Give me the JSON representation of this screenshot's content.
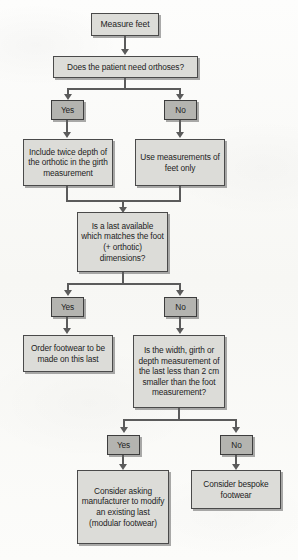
{
  "figure": {
    "type": "flowchart",
    "background_color": "#fbfbf9",
    "node_fill_color": "#dcdcd8",
    "branch_fill_color": "#b4b4b0",
    "border_color": "#4a4a4a",
    "connector_color": "#5b5b5b"
  },
  "nodes": {
    "measure_feet": "Measure feet",
    "need_orthoses": "Does the patient need orthoses?",
    "branch_orthoses_yes": "Yes",
    "branch_orthoses_no": "No",
    "include_twice_depth": "Include twice depth of the orthotic in the girth measurement",
    "use_measurements_feet": "Use measurements of feet only",
    "last_available": "Is a last available which matches the foot (+ orthotic) dimensions?",
    "branch_last_yes": "Yes",
    "branch_last_no": "No",
    "order_footwear": "Order footwear to be made on this last",
    "width_girth_depth": "Is the width, girth or depth measurement of the last less than 2 cm smaller than the foot measurement?",
    "branch_width_yes": "Yes",
    "branch_width_no": "No",
    "consider_modular": "Consider asking manufacturer to modify an existing last (modular footwear)",
    "consider_bespoke": "Consider bespoke footwear"
  }
}
